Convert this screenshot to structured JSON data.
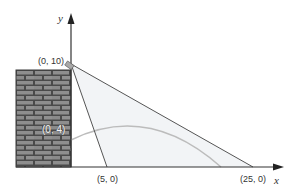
{
  "figure": {
    "axes": {
      "x_label": "x",
      "y_label": "y"
    },
    "points": {
      "lamp": "(0, 10)",
      "near_ground": "(5, 0)",
      "far_ground": "(25, 0)",
      "wall_point": "(0, 4)"
    },
    "colors": {
      "axis": "#333333",
      "line": "#555555",
      "parabola": "#bcbcbc",
      "shade": "#f2f4f6",
      "brick": "#8a8a8a",
      "mortar": "#4a4a4a"
    }
  }
}
